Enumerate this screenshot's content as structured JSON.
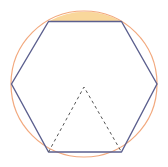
{
  "diagram": {
    "type": "geometry",
    "width": 168,
    "height": 167,
    "circle": {
      "cx": 84,
      "cy": 84,
      "r": 73,
      "stroke": "#F2A97E",
      "stroke_width": 1.2
    },
    "hexagon": {
      "points": [
        [
          48.5,
          21.5
        ],
        [
          121.5,
          21.5
        ],
        [
          157,
          84
        ],
        [
          121.5,
          152
        ],
        [
          48.5,
          152
        ],
        [
          11.5,
          84
        ]
      ],
      "stroke": "#5B5F8E",
      "stroke_width": 1.4
    },
    "shaded_segment": {
      "fill": "#F9D79B",
      "from": [
        48.5,
        21.5
      ],
      "to": [
        121.5,
        21.5
      ]
    },
    "dashed_triangle": {
      "apex": [
        84,
        87
      ],
      "base_left": [
        48.5,
        152
      ],
      "base_right": [
        121.5,
        152
      ],
      "stroke": "#555555",
      "dash": "3,3"
    }
  }
}
